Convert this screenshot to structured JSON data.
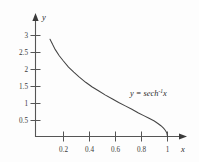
{
  "chart_data": {
    "type": "line",
    "title": "",
    "xlabel": "x",
    "ylabel": "y",
    "equation_label": "y = sech",
    "equation_exponent": "-1",
    "equation_tail": "x",
    "xlim": [
      0,
      1.12
    ],
    "ylim": [
      0,
      3.25
    ],
    "grid": false,
    "legend": "none",
    "x_ticks": [
      "0.2",
      "0.4",
      "0.6",
      "0.8",
      "1"
    ],
    "x_tick_values": [
      0.2,
      0.4,
      0.6,
      0.8,
      1
    ],
    "y_ticks": [
      "0.5",
      "1",
      "1.5",
      "2",
      "2.5",
      "3"
    ],
    "y_tick_values": [
      0.5,
      1,
      1.5,
      2,
      2.5,
      3
    ],
    "series": [
      {
        "name": "y = sech^-1 x",
        "x": [
          0.11,
          0.13,
          0.15,
          0.18,
          0.21,
          0.25,
          0.29,
          0.33,
          0.38,
          0.43,
          0.48,
          0.53,
          0.58,
          0.63,
          0.68,
          0.73,
          0.78,
          0.82,
          0.86,
          0.9,
          0.93,
          0.95,
          0.97,
          0.98,
          0.99,
          0.995,
          1.0
        ],
        "y": [
          2.89,
          2.73,
          2.58,
          2.4,
          2.25,
          2.06,
          1.91,
          1.77,
          1.61,
          1.47,
          1.35,
          1.23,
          1.12,
          1.01,
          0.91,
          0.81,
          0.7,
          0.62,
          0.54,
          0.46,
          0.38,
          0.32,
          0.25,
          0.2,
          0.14,
          0.1,
          0.0
        ]
      }
    ]
  },
  "colors": {
    "curve": "#444444",
    "axis": "#555555",
    "text": "#2a2a2a",
    "background": "#fdfdfd"
  },
  "icons": {
    "y_axis_arrow": "arrow-up-icon",
    "x_axis_arrow": "arrow-right-icon"
  }
}
